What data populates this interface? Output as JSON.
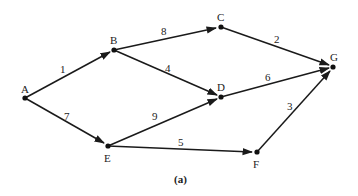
{
  "caption": "(a)",
  "nodes": {
    "A": {
      "label": "A",
      "x": 25,
      "y": 98
    },
    "B": {
      "label": "B",
      "x": 114,
      "y": 50
    },
    "C": {
      "label": "C",
      "x": 221,
      "y": 27
    },
    "D": {
      "label": "D",
      "x": 221,
      "y": 97
    },
    "E": {
      "label": "E",
      "x": 108,
      "y": 146
    },
    "F": {
      "label": "F",
      "x": 257,
      "y": 152
    },
    "G": {
      "label": "G",
      "x": 333,
      "y": 67
    }
  },
  "edges": [
    {
      "from": "A",
      "to": "B",
      "weight": "1"
    },
    {
      "from": "A",
      "to": "E",
      "weight": "7"
    },
    {
      "from": "B",
      "to": "C",
      "weight": "8"
    },
    {
      "from": "B",
      "to": "D",
      "weight": "4"
    },
    {
      "from": "C",
      "to": "G",
      "weight": "2"
    },
    {
      "from": "D",
      "to": "G",
      "weight": "6"
    },
    {
      "from": "E",
      "to": "D",
      "weight": "9"
    },
    {
      "from": "E",
      "to": "F",
      "weight": "5"
    },
    {
      "from": "F",
      "to": "G",
      "weight": "3"
    }
  ]
}
